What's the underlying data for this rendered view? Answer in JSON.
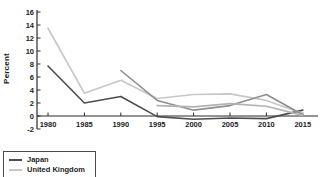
{
  "chart_data": {
    "type": "line",
    "title": "",
    "xlabel": "",
    "ylabel": "Percent",
    "x": [
      1980,
      1985,
      1990,
      1995,
      2000,
      2005,
      2010,
      2015
    ],
    "ylim": [
      -2,
      16
    ],
    "yticks": [
      16,
      14,
      12,
      10,
      8,
      6,
      4,
      2,
      0,
      -2
    ],
    "grid": false,
    "legend_position": "bottom-left-outside",
    "legend_note": "legend box is clipped by the bottom edge of the image; only two entries visible",
    "series": [
      {
        "name": "Japan",
        "color": "#4d4d4d",
        "in_legend": true,
        "values": [
          7.7,
          2.0,
          3.0,
          -0.1,
          -0.5,
          -0.3,
          -0.4,
          0.9
        ]
      },
      {
        "name": "United Kingdom",
        "color": "#c7c7c7",
        "in_legend": true,
        "values": [
          13.5,
          3.5,
          5.5,
          2.7,
          3.3,
          3.4,
          2.4,
          0.4
        ]
      },
      {
        "name": "",
        "color": "#8f8f8f",
        "in_legend": false,
        "values": [
          null,
          null,
          7.0,
          2.4,
          0.9,
          1.6,
          3.3,
          0.2
        ]
      },
      {
        "name": "",
        "color": "#b3b3b3",
        "in_legend": false,
        "values": [
          null,
          null,
          null,
          1.6,
          1.4,
          1.9,
          1.5,
          0.1
        ]
      }
    ],
    "axis_color": "#2b2b2b",
    "tick_label_color": "#1c1c1c"
  }
}
